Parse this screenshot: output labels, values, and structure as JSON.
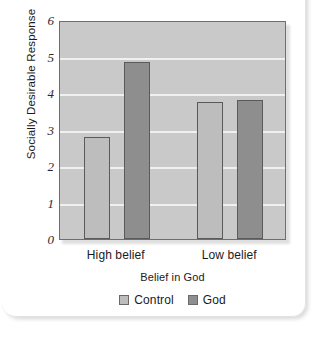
{
  "chart_data": {
    "type": "bar",
    "title": "",
    "xlabel": "Belief in God",
    "ylabel": "Socially Desirable Response",
    "categories": [
      "High belief",
      "Low belief"
    ],
    "series": [
      {
        "name": "Control",
        "color": "#bdbdbd",
        "values": [
          2.8,
          3.75
        ]
      },
      {
        "name": "God",
        "color": "#8e8e8e",
        "values": [
          4.85,
          3.82
        ]
      }
    ],
    "ylim": [
      0,
      6
    ],
    "yticks": [
      "0",
      "1",
      "2",
      "3",
      "4",
      "5",
      "6"
    ],
    "ytick_values": [
      0,
      1,
      2,
      3,
      4,
      5,
      6
    ],
    "grid": true,
    "grid_color": "#f0f0f0",
    "plot_background": "#c9c9c9",
    "legend_position": "bottom",
    "legend": [
      "Control",
      "God"
    ]
  },
  "axes": {
    "y_title": "Socially Desirable Response",
    "x_title": "Belief in God"
  },
  "ticks": {
    "y": [
      {
        "label": "6"
      },
      {
        "label": "5"
      },
      {
        "label": "4"
      },
      {
        "label": "3"
      },
      {
        "label": "2"
      },
      {
        "label": "1"
      },
      {
        "label": "0"
      }
    ],
    "x": [
      {
        "label": "High belief"
      },
      {
        "label": "Low belief"
      }
    ]
  },
  "legend": {
    "items": [
      {
        "label": "Control",
        "color": "#bdbdbd"
      },
      {
        "label": "God",
        "color": "#8e8e8e"
      }
    ]
  }
}
